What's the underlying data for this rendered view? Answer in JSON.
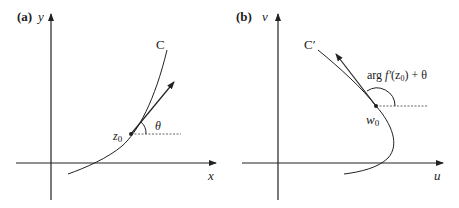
{
  "panel_a": {
    "tag": "(a)",
    "x_axis_label": "x",
    "y_axis_label": "y",
    "curve_label": "C",
    "point_label": "z",
    "point_subscript": "0",
    "angle_label": "θ"
  },
  "panel_b": {
    "tag": "(b)",
    "x_axis_label": "u",
    "y_axis_label": "v",
    "curve_label": "C′",
    "point_label": "w",
    "point_subscript": "0",
    "angle_label_prefix": "arg ",
    "angle_label_f": "f′",
    "angle_label_mid": "(z",
    "angle_label_sub": "0",
    "angle_label_suffix": ") + θ"
  },
  "colors": {
    "ink": "#222222",
    "dotted": "#666666"
  }
}
